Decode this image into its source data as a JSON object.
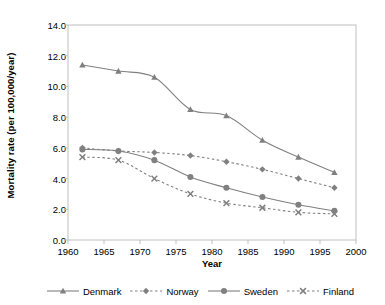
{
  "chart_data": {
    "type": "line",
    "title": "",
    "xlabel": "Year",
    "ylabel": "Mortality rate (per 100,000/year)",
    "xlim": [
      1960,
      2000
    ],
    "ylim": [
      0.0,
      14.0
    ],
    "grid": false,
    "legend_position": "bottom",
    "x_ticks": [
      "1960",
      "1965",
      "1970",
      "1975",
      "1980",
      "1985",
      "1990",
      "1995",
      "2000"
    ],
    "x_tick_values": [
      1960,
      1965,
      1970,
      1975,
      1980,
      1985,
      1990,
      1995,
      2000
    ],
    "y_ticks": [
      "0.0",
      "2.0",
      "4.0",
      "6.0",
      "8.0",
      "10.0",
      "12.0",
      "14.0"
    ],
    "y_tick_values": [
      0.0,
      2.0,
      4.0,
      6.0,
      8.0,
      10.0,
      12.0,
      14.0
    ],
    "x": [
      1962,
      1967,
      1972,
      1977,
      1982,
      1987,
      1992,
      1997
    ],
    "series": [
      {
        "name": "Denmark",
        "marker": "triangle",
        "line_style": "solid",
        "color": "#808080",
        "values": [
          11.4,
          11.0,
          10.6,
          8.5,
          8.1,
          6.5,
          5.4,
          4.4
        ]
      },
      {
        "name": "Norway",
        "marker": "diamond",
        "line_style": "dotted",
        "color": "#808080",
        "values": [
          6.0,
          5.8,
          5.7,
          5.5,
          5.1,
          4.6,
          4.0,
          3.4
        ]
      },
      {
        "name": "Sweden",
        "marker": "circle",
        "line_style": "solid",
        "color": "#808080",
        "values": [
          5.9,
          5.8,
          5.2,
          4.1,
          3.4,
          2.8,
          2.3,
          1.9
        ]
      },
      {
        "name": "Finland",
        "marker": "x",
        "line_style": "dotted",
        "color": "#808080",
        "values": [
          5.4,
          5.2,
          4.0,
          3.0,
          2.4,
          2.1,
          1.8,
          1.7
        ]
      }
    ]
  },
  "legend": {
    "items": [
      {
        "label": "Denmark"
      },
      {
        "label": "Norway"
      },
      {
        "label": "Sweden"
      },
      {
        "label": "Finland"
      }
    ]
  },
  "axis_colors": {
    "frame": "#bfbfbf",
    "text": "#000000",
    "plot_background": "#ffffff"
  }
}
